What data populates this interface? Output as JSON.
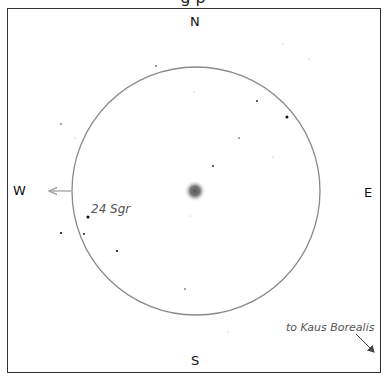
{
  "chart": {
    "caption_clipped": "g                 p",
    "directions": {
      "north": "N",
      "south": "S",
      "east": "E",
      "west": "W"
    },
    "field_circle": {
      "cx": 196,
      "cy": 191,
      "r": 124,
      "stroke": "#8a8a8a"
    },
    "target": {
      "name": "nebula-center",
      "cx": 195,
      "cy": 191
    },
    "labels": {
      "star_24_sgr": "24 Sgr",
      "pointer_kaus_borealis": "to Kaus Borealis"
    },
    "stars": [
      {
        "x": 283,
        "y": 44,
        "r": 0.6
      },
      {
        "x": 309,
        "y": 59,
        "r": 0.5
      },
      {
        "x": 156,
        "y": 66,
        "r": 0.8
      },
      {
        "x": 194,
        "y": 92,
        "r": 0.5
      },
      {
        "x": 257,
        "y": 101,
        "r": 0.9
      },
      {
        "x": 287,
        "y": 117,
        "r": 1.5
      },
      {
        "x": 61,
        "y": 124,
        "r": 0.7
      },
      {
        "x": 75,
        "y": 138,
        "r": 0.5
      },
      {
        "x": 239,
        "y": 138,
        "r": 0.7
      },
      {
        "x": 273,
        "y": 157,
        "r": 0.6
      },
      {
        "x": 213,
        "y": 166,
        "r": 0.9
      },
      {
        "x": 190,
        "y": 216,
        "r": 0.5
      },
      {
        "x": 88,
        "y": 217,
        "r": 1.6
      },
      {
        "x": 61,
        "y": 233,
        "r": 1.1
      },
      {
        "x": 84,
        "y": 234,
        "r": 0.9
      },
      {
        "x": 117,
        "y": 251,
        "r": 1.1
      },
      {
        "x": 185,
        "y": 289,
        "r": 0.7
      },
      {
        "x": 228,
        "y": 332,
        "r": 0.5
      }
    ]
  }
}
